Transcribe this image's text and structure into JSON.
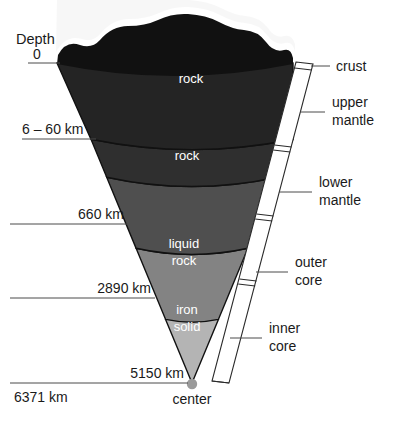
{
  "diagram": {
    "depth_axis_label": "Depth",
    "center_label": "center",
    "depth_labels": [
      {
        "text": "0",
        "depth_km": 0
      },
      {
        "text": "6 – 60 km",
        "depth_km": 33
      },
      {
        "text": "660 km",
        "depth_km": 660
      },
      {
        "text": "2890 km",
        "depth_km": 2890
      },
      {
        "text": "5150 km",
        "depth_km": 5150
      },
      {
        "text": "6371 km",
        "depth_km": 6371
      }
    ],
    "layers": [
      {
        "name": "crust-surface",
        "label": "",
        "color": "#1c1c1c"
      },
      {
        "name": "upper-mantle-top",
        "label": "rock",
        "color": "#2f2f2f"
      },
      {
        "name": "upper-lower-mantle",
        "label": "rock",
        "color": "#4f4f4f"
      },
      {
        "name": "outer-core",
        "label": "liquid\nrock",
        "label_line1": "liquid",
        "label_line2": "rock",
        "color": "#838383"
      },
      {
        "name": "inner-core",
        "label": "iron\nsolid",
        "label_line1": "iron",
        "label_line2": "solid",
        "color": "#b4b4b4"
      }
    ],
    "inner_labels": [
      {
        "text": "rock"
      },
      {
        "text": "rock"
      },
      {
        "text_line1": "liquid",
        "text_line2": "rock"
      },
      {
        "text_line1": "iron",
        "text_line2": "solid"
      }
    ],
    "side_labels": [
      {
        "text": "crust",
        "line1": "crust",
        "line2": ""
      },
      {
        "text": "upper mantle",
        "line1": "upper",
        "line2": "mantle"
      },
      {
        "text": "lower mantle",
        "line1": "lower",
        "line2": "mantle"
      },
      {
        "text": "outer core",
        "line1": "outer",
        "line2": "core"
      },
      {
        "text": "inner core",
        "line1": "inner",
        "line2": "core"
      }
    ],
    "colors": {
      "crust": "#1c1c1c",
      "upper_mantle": "#2f2f2f",
      "lower_mantle": "#4f4f4f",
      "outer_core": "#838383",
      "inner_core": "#b4b4b4",
      "center_dot": "#9a9a9a",
      "bracket_fill": "#ffffff",
      "outline": "#111111",
      "text": "#1a1a1a",
      "inner_text": "#ffffff",
      "leader": "#4a4a4a"
    }
  }
}
